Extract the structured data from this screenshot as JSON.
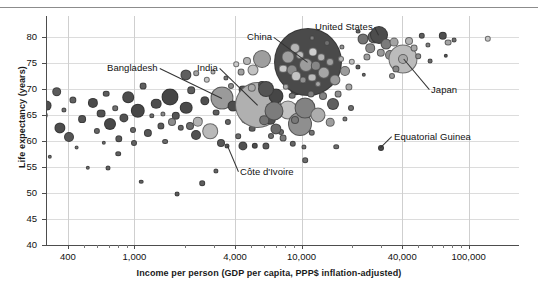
{
  "chart_data": {
    "type": "scatter",
    "title": "",
    "xlabel": "Income per person (GDP per capita, PPP$ inflation-adjusted)",
    "ylabel": "Life expectancy (years)",
    "xscale": "log",
    "xlim": [
      300,
      200000
    ],
    "ylim": [
      40,
      84
    ],
    "grid": true,
    "legend": "none",
    "xticks": [
      {
        "value": 400,
        "label": "400"
      },
      {
        "value": 1000,
        "label": "1,000"
      },
      {
        "value": 4000,
        "label": "4,000"
      },
      {
        "value": 10000,
        "label": "10,000"
      },
      {
        "value": 40000,
        "label": "40,000"
      },
      {
        "value": 100000,
        "label": "100,000"
      }
    ],
    "yticks": [
      {
        "value": 40,
        "label": "40"
      },
      {
        "value": 45,
        "label": "45"
      },
      {
        "value": 50,
        "label": "50"
      },
      {
        "value": 55,
        "label": "55"
      },
      {
        "value": 60,
        "label": "60"
      },
      {
        "value": 65,
        "label": "65"
      },
      {
        "value": 70,
        "label": "70"
      },
      {
        "value": 75,
        "label": "75"
      },
      {
        "value": 80,
        "label": "80"
      }
    ],
    "annotations": [
      {
        "label": "Bangladesh",
        "text_x": 107,
        "text_y": 62,
        "point_x": 222,
        "point_y": 98
      },
      {
        "label": "India",
        "text_x": 197,
        "text_y": 62,
        "point_x": 258,
        "point_y": 105
      },
      {
        "label": "China",
        "text_x": 247,
        "text_y": 31,
        "point_x": 308,
        "point_y": 62
      },
      {
        "label": "United States",
        "text_x": 315,
        "text_y": 21,
        "point_x": 379,
        "point_y": 35
      },
      {
        "label": "Japan",
        "text_x": 431,
        "text_y": 84,
        "point_x": 403,
        "point_y": 59
      },
      {
        "label": "Côte d'Ivoire",
        "text_x": 240,
        "text_y": 166,
        "point_x": 227,
        "point_y": 146
      },
      {
        "label": "Equatorial Guinea",
        "text_x": 394,
        "text_y": 131,
        "point_x": 381,
        "point_y": 148
      }
    ],
    "points": [
      {
        "x": 10.0,
        "y": 149.0,
        "r": 3.0,
        "c": "#6b6b6b"
      },
      {
        "x": 18.5,
        "y": 127.5,
        "r": 3.6,
        "c": "#5e5e5e"
      },
      {
        "x": 21.0,
        "y": 164.5,
        "r": 2.6,
        "c": "#6f6f6f"
      },
      {
        "x": 30.0,
        "y": 140.0,
        "r": 4.3,
        "c": "#575757"
      },
      {
        "x": 34.0,
        "y": 133.5,
        "r": 6.4,
        "c": "#4a4a4a"
      },
      {
        "x": 37.5,
        "y": 145.0,
        "r": 3.2,
        "c": "#636363"
      },
      {
        "x": 44.0,
        "y": 115.0,
        "r": 3.3,
        "c": "#5a5a5a"
      },
      {
        "x": 46.5,
        "y": 105.5,
        "r": 5.4,
        "c": "#4f4f4f"
      },
      {
        "x": 50.0,
        "y": 156.5,
        "r": 2.2,
        "c": "#6a6a6a"
      },
      {
        "x": 56.5,
        "y": 91.5,
        "r": 4.8,
        "c": "#5b5b5b"
      },
      {
        "x": 60.0,
        "y": 127.5,
        "r": 5.6,
        "c": "#4d4d4d"
      },
      {
        "x": 64.0,
        "y": 110.0,
        "r": 2.6,
        "c": "#6e6e6e"
      },
      {
        "x": 69.0,
        "y": 136.5,
        "r": 5.0,
        "c": "#565656"
      },
      {
        "x": 73.0,
        "y": 100.0,
        "r": 3.6,
        "c": "#606060"
      },
      {
        "x": 76.5,
        "y": 147.5,
        "r": 2.4,
        "c": "#727272"
      },
      {
        "x": 82.0,
        "y": 119.0,
        "r": 3.9,
        "c": "#545454"
      },
      {
        "x": 88.0,
        "y": 168.0,
        "r": 2.2,
        "c": "#6a6a6a"
      },
      {
        "x": 92.5,
        "y": 103.0,
        "r": 5.1,
        "c": "#4b4b4b"
      },
      {
        "x": 97.0,
        "y": 131.0,
        "r": 3.1,
        "c": "#666666"
      },
      {
        "x": 101.0,
        "y": 113.5,
        "r": 4.4,
        "c": "#515151"
      },
      {
        "x": 106.0,
        "y": 93.5,
        "r": 3.3,
        "c": "#5d5d5d"
      },
      {
        "x": 110.0,
        "y": 124.0,
        "r": 6.0,
        "c": "#484848"
      },
      {
        "x": 115.0,
        "y": 108.0,
        "r": 2.8,
        "c": "#707070"
      },
      {
        "x": 119.0,
        "y": 139.0,
        "r": 3.7,
        "c": "#5a5a5a"
      },
      {
        "x": 123.5,
        "y": 118.0,
        "r": 4.6,
        "c": "#525252"
      },
      {
        "x": 128.0,
        "y": 97.0,
        "r": 5.8,
        "c": "#4c4c4c"
      },
      {
        "x": 133.0,
        "y": 129.5,
        "r": 3.0,
        "c": "#686868"
      },
      {
        "x": 138.0,
        "y": 111.0,
        "r": 7.2,
        "c": "#474747"
      },
      {
        "x": 143.0,
        "y": 86.0,
        "r": 3.4,
        "c": "#5f5f5f"
      },
      {
        "x": 147.5,
        "y": 133.0,
        "r": 4.1,
        "c": "#565656"
      },
      {
        "x": 152.0,
        "y": 116.0,
        "r": 2.7,
        "c": "#6c6c6c"
      },
      {
        "x": 156.0,
        "y": 103.5,
        "r": 5.3,
        "c": "#4e4e4e"
      },
      {
        "x": 161.0,
        "y": 126.0,
        "r": 3.6,
        "c": "#5b5b5b"
      },
      {
        "x": 165.0,
        "y": 141.5,
        "r": 2.9,
        "c": "#6a6a6a"
      },
      {
        "x": 170.0,
        "y": 96.5,
        "r": 8.5,
        "c": "#454545"
      },
      {
        "x": 176.0,
        "y": 115.5,
        "r": 4.2,
        "c": "#555555"
      },
      {
        "x": 181.0,
        "y": 128.0,
        "r": 3.2,
        "c": "#636363"
      },
      {
        "x": 186.0,
        "y": 107.5,
        "r": 6.3,
        "c": "#4a4a4a"
      },
      {
        "x": 191.0,
        "y": 90.0,
        "r": 3.8,
        "c": "#5c5c5c"
      },
      {
        "x": 196.0,
        "y": 134.5,
        "r": 5.0,
        "c": "#515151"
      },
      {
        "x": 200.0,
        "y": 120.0,
        "r": 2.6,
        "c": "#6e6e6e"
      },
      {
        "x": 205.0,
        "y": 101.0,
        "r": 4.7,
        "c": "#4f4f4f"
      },
      {
        "x": 210.0,
        "y": 131.0,
        "r": 7.8,
        "c": "#b9b9b9"
      },
      {
        "x": 216.0,
        "y": 112.5,
        "r": 3.4,
        "c": "#5e5e5e"
      },
      {
        "x": 221.0,
        "y": 143.0,
        "r": 4.0,
        "c": "#575757"
      },
      {
        "x": 222.0,
        "y": 98.0,
        "r": 11.5,
        "c": "#9a9a9a"
      },
      {
        "x": 228.0,
        "y": 122.0,
        "r": 3.1,
        "c": "#666666"
      },
      {
        "x": 233.0,
        "y": 106.0,
        "r": 5.5,
        "c": "#4d4d4d"
      },
      {
        "x": 238.0,
        "y": 136.0,
        "r": 2.8,
        "c": "#6b6b6b"
      },
      {
        "x": 243.0,
        "y": 89.5,
        "r": 4.4,
        "c": "#545454"
      },
      {
        "x": 247.0,
        "y": 117.0,
        "r": 6.8,
        "c": "#a8a8a8"
      },
      {
        "x": 252.0,
        "y": 128.5,
        "r": 3.3,
        "c": "#606060"
      },
      {
        "x": 258.0,
        "y": 105.0,
        "r": 23.0,
        "c": "#b0b0b0"
      },
      {
        "x": 262.0,
        "y": 84.5,
        "r": 3.9,
        "c": "#585858"
      },
      {
        "x": 266.0,
        "y": 145.5,
        "r": 3.6,
        "c": "#5a5a5a"
      },
      {
        "x": 271.0,
        "y": 119.5,
        "r": 5.2,
        "c": "#505050"
      },
      {
        "x": 276.0,
        "y": 96.0,
        "r": 7.5,
        "c": "#464646"
      },
      {
        "x": 281.0,
        "y": 132.0,
        "r": 3.0,
        "c": "#696969"
      },
      {
        "x": 284.0,
        "y": 76.5,
        "r": 4.6,
        "c": "#535353"
      },
      {
        "x": 288.0,
        "y": 110.0,
        "r": 9.5,
        "c": "#c2c2c2"
      },
      {
        "x": 293.0,
        "y": 144.0,
        "r": 3.2,
        "c": "#646464"
      },
      {
        "x": 296.0,
        "y": 89.0,
        "r": 5.8,
        "c": "#4b4b4b"
      },
      {
        "x": 300.0,
        "y": 124.0,
        "r": 12.0,
        "c": "#8f8f8f"
      },
      {
        "x": 305.0,
        "y": 160.0,
        "r": 2.8,
        "c": "#6d6d6d"
      },
      {
        "x": 308.0,
        "y": 62.0,
        "r": 34.0,
        "c": "#4a4a4a"
      },
      {
        "x": 295.0,
        "y": 48.0,
        "r": 5.0,
        "c": "#b5b5b5"
      },
      {
        "x": 288.0,
        "y": 57.0,
        "r": 6.5,
        "c": "#a0a0a0"
      },
      {
        "x": 283.0,
        "y": 68.5,
        "r": 4.3,
        "c": "#c8c8c8"
      },
      {
        "x": 292.0,
        "y": 70.0,
        "r": 5.5,
        "c": "#8b8b8b"
      },
      {
        "x": 300.0,
        "y": 55.0,
        "r": 4.0,
        "c": "#bdbdbd"
      },
      {
        "x": 306.0,
        "y": 64.5,
        "r": 7.0,
        "c": "#9c9c9c"
      },
      {
        "x": 313.0,
        "y": 51.5,
        "r": 4.6,
        "c": "#cfcfcf"
      },
      {
        "x": 316.0,
        "y": 66.0,
        "r": 5.2,
        "c": "#868686"
      },
      {
        "x": 321.0,
        "y": 57.0,
        "r": 3.8,
        "c": "#b2b2b2"
      },
      {
        "x": 324.0,
        "y": 72.5,
        "r": 6.2,
        "c": "#a6a6a6"
      },
      {
        "x": 312.0,
        "y": 77.5,
        "r": 4.4,
        "c": "#bbbbbb"
      },
      {
        "x": 303.0,
        "y": 79.5,
        "r": 3.5,
        "c": "#909090"
      },
      {
        "x": 296.0,
        "y": 76.0,
        "r": 4.9,
        "c": "#c4c4c4"
      },
      {
        "x": 330.0,
        "y": 62.0,
        "r": 4.0,
        "c": "#9f9f9f"
      },
      {
        "x": 286.0,
        "y": 86.5,
        "r": 3.2,
        "c": "#ababab"
      },
      {
        "x": 318.0,
        "y": 84.0,
        "r": 3.0,
        "c": "#a4a4a4"
      },
      {
        "x": 292.0,
        "y": 95.5,
        "r": 3.3,
        "c": "#767676"
      },
      {
        "x": 311.0,
        "y": 94.0,
        "r": 3.6,
        "c": "#7d7d7d"
      },
      {
        "x": 323.0,
        "y": 96.0,
        "r": 4.0,
        "c": "#838383"
      },
      {
        "x": 335.0,
        "y": 79.5,
        "r": 5.6,
        "c": "#9a9a9a"
      },
      {
        "x": 338.0,
        "y": 94.0,
        "r": 3.4,
        "c": "#8e8e8e"
      },
      {
        "x": 333.0,
        "y": 104.0,
        "r": 6.0,
        "c": "#606060"
      },
      {
        "x": 341.0,
        "y": 59.0,
        "r": 3.0,
        "c": "#b8b8b8"
      },
      {
        "x": 345.0,
        "y": 71.0,
        "r": 5.0,
        "c": "#9b9b9b"
      },
      {
        "x": 349.0,
        "y": 86.5,
        "r": 3.6,
        "c": "#a7a7a7"
      },
      {
        "x": 352.0,
        "y": 62.0,
        "r": 3.2,
        "c": "#c0c0c0"
      },
      {
        "x": 305.0,
        "y": 108.0,
        "r": 10.5,
        "c": "#828282"
      },
      {
        "x": 318.0,
        "y": 115.0,
        "r": 7.5,
        "c": "#adadad"
      },
      {
        "x": 295.0,
        "y": 120.0,
        "r": 4.0,
        "c": "#787878"
      },
      {
        "x": 330.0,
        "y": 122.0,
        "r": 4.3,
        "c": "#9d9d9d"
      },
      {
        "x": 312.0,
        "y": 132.5,
        "r": 3.2,
        "c": "#727272"
      },
      {
        "x": 276.0,
        "y": 128.5,
        "r": 5.6,
        "c": "#6b6b6b"
      },
      {
        "x": 264.0,
        "y": 120.0,
        "r": 4.8,
        "c": "#737373"
      },
      {
        "x": 271.0,
        "y": 136.0,
        "r": 3.0,
        "c": "#707070"
      },
      {
        "x": 283.0,
        "y": 138.0,
        "r": 3.4,
        "c": "#7a7a7a"
      },
      {
        "x": 304.0,
        "y": 146.5,
        "r": 2.6,
        "c": "#747474"
      },
      {
        "x": 336.0,
        "y": 146.5,
        "r": 2.8,
        "c": "#6e6e6e"
      },
      {
        "x": 255.0,
        "y": 146.0,
        "r": 3.2,
        "c": "#4e4e4e"
      },
      {
        "x": 243.0,
        "y": 145.5,
        "r": 4.6,
        "c": "#505050"
      },
      {
        "x": 227.0,
        "y": 146.0,
        "r": 2.5,
        "c": "#595959"
      },
      {
        "x": 216.0,
        "y": 170.5,
        "r": 2.6,
        "c": "#646464"
      },
      {
        "x": 202.0,
        "y": 183.0,
        "r": 2.8,
        "c": "#5d5d5d"
      },
      {
        "x": 177.0,
        "y": 194.0,
        "r": 2.4,
        "c": "#5a5a5a"
      },
      {
        "x": 141.0,
        "y": 181.5,
        "r": 2.3,
        "c": "#606060"
      },
      {
        "x": 108.0,
        "y": 167.5,
        "r": 2.5,
        "c": "#626262"
      },
      {
        "x": 363.0,
        "y": 39.0,
        "r": 5.5,
        "c": "#737373"
      },
      {
        "x": 370.0,
        "y": 48.0,
        "r": 4.8,
        "c": "#8a8a8a"
      },
      {
        "x": 367.0,
        "y": 56.5,
        "r": 3.6,
        "c": "#9e9e9e"
      },
      {
        "x": 374.0,
        "y": 36.5,
        "r": 6.5,
        "c": "#636363"
      },
      {
        "x": 379.0,
        "y": 35.0,
        "r": 9.0,
        "c": "#4d4d4d"
      },
      {
        "x": 386.0,
        "y": 44.0,
        "r": 5.4,
        "c": "#7b7b7b"
      },
      {
        "x": 381.0,
        "y": 52.5,
        "r": 4.2,
        "c": "#999999"
      },
      {
        "x": 390.0,
        "y": 55.0,
        "r": 5.0,
        "c": "#8d8d8d"
      },
      {
        "x": 394.0,
        "y": 42.0,
        "r": 4.4,
        "c": "#a3a3a3"
      },
      {
        "x": 398.0,
        "y": 50.0,
        "r": 3.6,
        "c": "#bcbcbc"
      },
      {
        "x": 403.0,
        "y": 59.0,
        "r": 14.5,
        "c": "#bcbcbc"
      },
      {
        "x": 403.0,
        "y": 59.0,
        "r": 5.0,
        "c": "#aaaaaa"
      },
      {
        "x": 409.0,
        "y": 40.5,
        "r": 4.0,
        "c": "#b4b4b4"
      },
      {
        "x": 414.0,
        "y": 48.0,
        "r": 3.4,
        "c": "#a8a8a8"
      },
      {
        "x": 396.0,
        "y": 69.0,
        "r": 3.6,
        "c": "#888888"
      },
      {
        "x": 392.0,
        "y": 76.0,
        "r": 3.0,
        "c": "#9c9c9c"
      },
      {
        "x": 418.0,
        "y": 56.0,
        "r": 2.8,
        "c": "#8f8f8f"
      },
      {
        "x": 422.0,
        "y": 36.0,
        "r": 3.2,
        "c": "#5e5e5e"
      },
      {
        "x": 428.0,
        "y": 44.5,
        "r": 2.6,
        "c": "#7f7f7f"
      },
      {
        "x": 430.0,
        "y": 61.0,
        "r": 2.4,
        "c": "#6a6a6a"
      },
      {
        "x": 443.0,
        "y": 35.5,
        "r": 4.2,
        "c": "#4f4f4f"
      },
      {
        "x": 448.0,
        "y": 42.5,
        "r": 3.4,
        "c": "#a5a5a5"
      },
      {
        "x": 454.0,
        "y": 40.0,
        "r": 2.4,
        "c": "#6d6d6d"
      },
      {
        "x": 446.0,
        "y": 56.0,
        "r": 2.2,
        "c": "#555555"
      },
      {
        "x": 358.0,
        "y": 31.5,
        "r": 2.4,
        "c": "#656565"
      },
      {
        "x": 488.0,
        "y": 39.0,
        "r": 3.2,
        "c": "#c6c6c6"
      },
      {
        "x": 381.0,
        "y": 148.0,
        "r": 3.0,
        "c": "#4a4a4a"
      },
      {
        "x": 351.0,
        "y": 108.0,
        "r": 3.0,
        "c": "#707070"
      },
      {
        "x": 345.0,
        "y": 119.0,
        "r": 2.6,
        "c": "#7a7a7a"
      },
      {
        "x": 262.0,
        "y": 59.0,
        "r": 9.0,
        "c": "#9e9e9e"
      },
      {
        "x": 253.0,
        "y": 70.0,
        "r": 5.5,
        "c": "#c2c2c2"
      },
      {
        "x": 247.0,
        "y": 60.5,
        "r": 4.0,
        "c": "#b6b6b6"
      },
      {
        "x": 241.0,
        "y": 72.0,
        "r": 3.4,
        "c": "#a0a0a0"
      },
      {
        "x": 236.0,
        "y": 64.0,
        "r": 2.8,
        "c": "#cbcbcb"
      },
      {
        "x": 266.0,
        "y": 88.5,
        "r": 8.0,
        "c": "#545454"
      },
      {
        "x": 252.0,
        "y": 88.0,
        "r": 4.2,
        "c": "#a9a9a9"
      },
      {
        "x": 274.0,
        "y": 110.5,
        "r": 9.5,
        "c": "#7c7c7c"
      },
      {
        "x": 231.0,
        "y": 86.0,
        "r": 3.0,
        "c": "#8b8b8b"
      },
      {
        "x": 226.0,
        "y": 78.0,
        "r": 2.6,
        "c": "#777777"
      },
      {
        "x": 207.0,
        "y": 79.5,
        "r": 3.2,
        "c": "#c4c4c4"
      },
      {
        "x": 213.0,
        "y": 71.5,
        "r": 2.5,
        "c": "#b0b0b0"
      },
      {
        "x": 196.0,
        "y": 73.0,
        "r": 2.8,
        "c": "#a2a2a2"
      },
      {
        "x": 186.0,
        "y": 74.5,
        "r": 5.6,
        "c": "#5e5e5e"
      },
      {
        "x": 172.0,
        "y": 122.0,
        "r": 4.0,
        "c": "#8c8c8c"
      },
      {
        "x": 198.0,
        "y": 122.0,
        "r": 5.2,
        "c": "#b2b2b2"
      },
      {
        "x": 190.0,
        "y": 125.5,
        "r": 4.0,
        "c": "#6c6c6c"
      },
      {
        "x": 163.0,
        "y": 114.0,
        "r": 2.6,
        "c": "#8a8a8a"
      },
      {
        "x": 134.0,
        "y": 142.5,
        "r": 3.0,
        "c": "#636363"
      },
      {
        "x": 118.0,
        "y": 153.5,
        "r": 2.8,
        "c": "#5f5f5f"
      },
      {
        "x": 104.0,
        "y": 143.0,
        "r": 2.2,
        "c": "#6b6b6b"
      },
      {
        "x": 358.0,
        "y": 67.0,
        "r": 2.6,
        "c": "#5b5b5b"
      },
      {
        "x": 364.0,
        "y": 75.0,
        "r": 2.2,
        "c": "#676767"
      },
      {
        "x": 342.0,
        "y": 47.0,
        "r": 2.6,
        "c": "#929292"
      },
      {
        "x": 327.0,
        "y": 43.0,
        "r": 3.0,
        "c": "#6f6f6f"
      },
      {
        "x": 312.0,
        "y": 38.0,
        "r": 2.4,
        "c": "#7e7e7e"
      }
    ]
  }
}
